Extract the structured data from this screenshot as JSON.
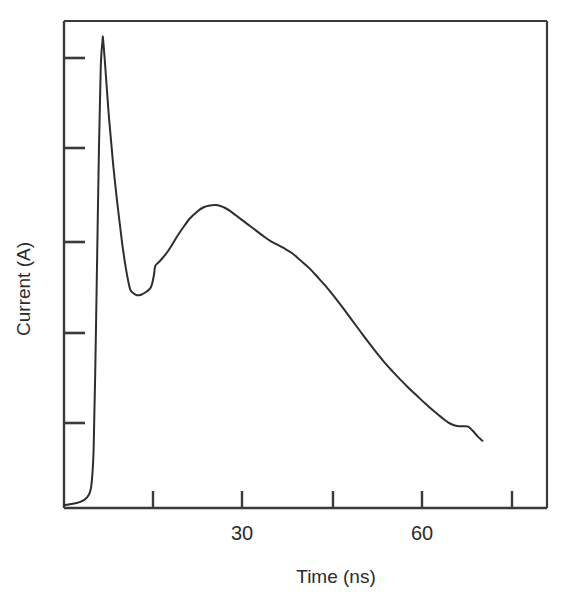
{
  "chart_data": {
    "type": "line",
    "title": "",
    "subtitle": "",
    "xlabel": "Time (ns)",
    "ylabel": "Current (A)",
    "xlim": [
      0,
      81.5
    ],
    "ylim": [
      0,
      1.0
    ],
    "grid": false,
    "legend": null,
    "x_ticks": [
      15,
      30,
      45,
      60,
      75
    ],
    "x_tick_labels": [
      "",
      "30",
      "",
      "60",
      ""
    ],
    "y_ticks": [
      0.2,
      0.4,
      0.6,
      0.8,
      1.0
    ],
    "y_tick_labels": [
      "",
      "",
      "",
      "",
      ""
    ],
    "annotations": [],
    "series": [
      {
        "name": "current waveform",
        "color": "#2e2e2e",
        "x": [
          0.0,
          1.2,
          2.6,
          3.9,
          4.6,
          5.0,
          5.3,
          5.6,
          5.9,
          6.2,
          6.5,
          6.6,
          7.0,
          7.6,
          8.3,
          9.1,
          9.8,
          10.4,
          10.9,
          11.2,
          11.6,
          12.3,
          13.0,
          13.9,
          14.6,
          14.9,
          15.2,
          15.4,
          16.0,
          16.9,
          17.9,
          19.0,
          20.1,
          21.2,
          22.4,
          23.5,
          24.6,
          25.6,
          26.4,
          27.2,
          28.0,
          29.1,
          30.3,
          31.5,
          32.7,
          33.9,
          35.0,
          36.0,
          37.2,
          38.4,
          39.5,
          40.4,
          41.5,
          42.8,
          44.2,
          45.6,
          47.0,
          48.4,
          49.8,
          51.2,
          52.6,
          54.0,
          55.4,
          56.8,
          58.2,
          59.6,
          61.0,
          62.4,
          63.8,
          64.8,
          65.8,
          66.6,
          67.4,
          68.2,
          69.0,
          69.8,
          70.6
        ],
        "y": [
          0.006,
          0.008,
          0.012,
          0.022,
          0.045,
          0.12,
          0.3,
          0.52,
          0.74,
          0.905,
          0.96,
          0.962,
          0.9,
          0.8,
          0.705,
          0.615,
          0.545,
          0.495,
          0.462,
          0.448,
          0.442,
          0.437,
          0.438,
          0.444,
          0.452,
          0.462,
          0.48,
          0.497,
          0.505,
          0.517,
          0.534,
          0.556,
          0.576,
          0.594,
          0.608,
          0.617,
          0.621,
          0.622,
          0.62,
          0.616,
          0.61,
          0.6,
          0.589,
          0.578,
          0.567,
          0.556,
          0.547,
          0.541,
          0.533,
          0.524,
          0.513,
          0.503,
          0.491,
          0.474,
          0.455,
          0.434,
          0.412,
          0.389,
          0.366,
          0.343,
          0.321,
          0.3,
          0.281,
          0.263,
          0.246,
          0.23,
          0.214,
          0.199,
          0.185,
          0.176,
          0.17,
          0.168,
          0.168,
          0.167,
          0.158,
          0.147,
          0.138
        ]
      }
    ],
    "features": {
      "initial_spike_time_ns": 6.6,
      "initial_spike_value": 0.962,
      "trough_time_ns": 13.0,
      "trough_value": 0.437,
      "secondary_peak_time_ns": 25.6,
      "secondary_peak_value": 0.622,
      "end_time_ns": 70.6,
      "end_value": 0.138
    }
  },
  "axes": {
    "x_axis_title": "Time (ns)",
    "y_axis_title": "Current (A)",
    "x_label_30": "30",
    "x_label_60": "60"
  },
  "colors": {
    "curve": "#2e2e2e",
    "frame": "#3a3a3a",
    "text": "#2b2b2b",
    "background": "#ffffff"
  }
}
